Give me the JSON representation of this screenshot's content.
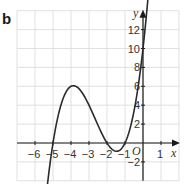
{
  "panel_label": "b",
  "chart_data": {
    "type": "line",
    "title": "",
    "xlabel": "x",
    "ylabel": "y",
    "origin_label": "O",
    "xlim": [
      -7,
      2
    ],
    "ylim": [
      -4,
      14
    ],
    "grid": true,
    "x_ticks": [
      -6,
      -5,
      -4,
      -3,
      -2,
      -1,
      1
    ],
    "x_tick_labels": [
      "−6",
      "−5",
      "−4",
      "−3",
      "−2",
      "−1",
      "1"
    ],
    "y_ticks": [
      12,
      10,
      8,
      6,
      4,
      2,
      -2
    ],
    "y_tick_labels": [
      "12",
      "10",
      "8",
      "6",
      "4",
      "2",
      "−2"
    ],
    "series": [
      {
        "name": "curve",
        "equation": "y = (x+5)(x+2)(x+1)",
        "x": [
          -5.3,
          -5,
          -4.5,
          -4,
          -3.5,
          -3,
          -2.5,
          -2,
          -1.5,
          -1,
          -0.5,
          0,
          0.3
        ],
        "y": [
          -3.9,
          0,
          4.4,
          6,
          5.6,
          4,
          1.9,
          0,
          -0.9,
          0,
          2.3,
          10,
          17
        ],
        "roots": [
          -5,
          -2,
          -1
        ],
        "local_max": {
          "x": -3.9,
          "y": 6.1
        },
        "local_min": {
          "x": -1.4,
          "y": -0.9
        },
        "y_intercept": 10
      }
    ],
    "colors": {
      "curve": "#2a2a2a",
      "grid": "#d8d8d8",
      "axes": "#1a1a1a"
    }
  }
}
